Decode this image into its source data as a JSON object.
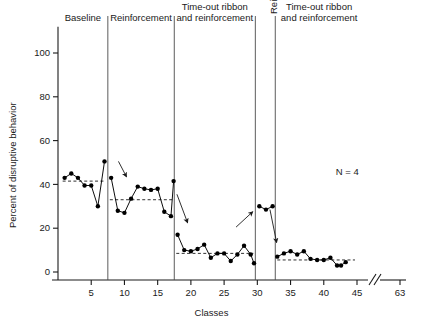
{
  "chart_data": {
    "type": "line",
    "title": "",
    "xlabel": "Classes",
    "ylabel": "Percent of disruptive behavior",
    "xlim": [
      0,
      46
    ],
    "ylim": [
      0,
      112
    ],
    "yticks": [
      0,
      20,
      40,
      60,
      80,
      100
    ],
    "ytick_labels": [
      "0",
      "20",
      "40",
      "60",
      "80",
      "100"
    ],
    "xticks": [
      5,
      10,
      15,
      20,
      25,
      30,
      35,
      40,
      45,
      63
    ],
    "xtick_labels": [
      "5",
      "10",
      "15",
      "20",
      "25",
      "30",
      "35",
      "40",
      "45",
      "63"
    ],
    "axis_break": {
      "present": true,
      "between": [
        45,
        63
      ],
      "symbol": "//"
    },
    "grid": false,
    "legend": false,
    "annotations": [
      {
        "name": "sample-size",
        "text": "N = 4",
        "x": 41.5,
        "y": 45
      }
    ],
    "phase_dividers": [
      7.5,
      17.5,
      29.7,
      32.7
    ],
    "phases": [
      {
        "name": "baseline",
        "label": "Baseline",
        "label_lines": [
          "Baseline"
        ],
        "orientation": "horizontal",
        "x_start": 1,
        "x_end": 7.5,
        "mean": 41.5
      },
      {
        "name": "reinforcement-1",
        "label": "Reinforcement",
        "label_lines": [
          "Reinforcement"
        ],
        "orientation": "horizontal",
        "x_start": 7.5,
        "x_end": 17.5,
        "mean": 33
      },
      {
        "name": "timeout-ribbon-and-reinforcement-1",
        "label": "Time-out ribbon and reinforcement",
        "label_lines": [
          "Time-out ribbon",
          "and reinforcement"
        ],
        "orientation": "horizontal",
        "x_start": 17.5,
        "x_end": 29.7,
        "mean": 8.5
      },
      {
        "name": "reinforcement-2",
        "label": "Reinforcement",
        "label_lines": [
          "Reinforcement"
        ],
        "orientation": "vertical",
        "x_start": 29.7,
        "x_end": 32.7,
        "mean": null
      },
      {
        "name": "timeout-ribbon-and-reinforcement-2",
        "label": "Time-out ribbon and reinforcement",
        "label_lines": [
          "Time-out ribbon",
          "and reinforcement"
        ],
        "orientation": "horizontal",
        "x_start": 32.7,
        "x_end": 45,
        "mean": 5.5
      }
    ],
    "arrows": [
      {
        "name": "arrow-baseline-to-reinforcement",
        "x1": 9.1,
        "y1": 50.5,
        "x2": 10.3,
        "y2": 43.5
      },
      {
        "name": "arrow-reinforcement-to-timeout",
        "x1": 17.9,
        "y1": 35.5,
        "x2": 19.5,
        "y2": 22.5
      },
      {
        "name": "arrow-timeout-to-reinforcement",
        "x1": 26.8,
        "y1": 20.5,
        "x2": 29.3,
        "y2": 27.5
      },
      {
        "name": "arrow-reinforcement-to-timeout-2",
        "x1": 31.9,
        "y1": 28.5,
        "x2": 32.9,
        "y2": 13.5
      }
    ],
    "series": [
      {
        "name": "percent-disruptive-behavior",
        "marker": "filled-circle",
        "color": "#000000",
        "points": [
          {
            "x": 1,
            "y": 43
          },
          {
            "x": 2,
            "y": 45
          },
          {
            "x": 3,
            "y": 43
          },
          {
            "x": 4,
            "y": 39.5
          },
          {
            "x": 5,
            "y": 39.5
          },
          {
            "x": 6,
            "y": 30
          },
          {
            "x": 7,
            "y": 50.5
          },
          {
            "x": 8,
            "y": 43
          },
          {
            "x": 9,
            "y": 28
          },
          {
            "x": 10,
            "y": 27
          },
          {
            "x": 11,
            "y": 33.5
          },
          {
            "x": 12,
            "y": 39
          },
          {
            "x": 13,
            "y": 38
          },
          {
            "x": 14,
            "y": 37.5
          },
          {
            "x": 15,
            "y": 38
          },
          {
            "x": 16,
            "y": 27.5
          },
          {
            "x": 17,
            "y": 25.5
          },
          {
            "x": 17.4,
            "y": 41.5
          },
          {
            "x": 18,
            "y": 17
          },
          {
            "x": 19,
            "y": 10
          },
          {
            "x": 20,
            "y": 9.5
          },
          {
            "x": 21,
            "y": 10.5
          },
          {
            "x": 22,
            "y": 12.5
          },
          {
            "x": 23,
            "y": 6.5
          },
          {
            "x": 24,
            "y": 8.5
          },
          {
            "x": 25,
            "y": 8.5
          },
          {
            "x": 26,
            "y": 5
          },
          {
            "x": 27,
            "y": 8
          },
          {
            "x": 28,
            "y": 12
          },
          {
            "x": 29,
            "y": 8
          },
          {
            "x": 29.5,
            "y": 4
          },
          {
            "x": 30.3,
            "y": 30
          },
          {
            "x": 31.3,
            "y": 28.5
          },
          {
            "x": 32.3,
            "y": 30
          },
          {
            "x": 33,
            "y": 7
          },
          {
            "x": 34,
            "y": 8.5
          },
          {
            "x": 35,
            "y": 9.5
          },
          {
            "x": 36,
            "y": 8
          },
          {
            "x": 37,
            "y": 9.5
          },
          {
            "x": 38,
            "y": 6
          },
          {
            "x": 39,
            "y": 5.5
          },
          {
            "x": 40,
            "y": 5.5
          },
          {
            "x": 41,
            "y": 6.5
          },
          {
            "x": 42,
            "y": 3
          },
          {
            "x": 42.6,
            "y": 3
          },
          {
            "x": 43.3,
            "y": 4.5
          }
        ]
      }
    ]
  }
}
